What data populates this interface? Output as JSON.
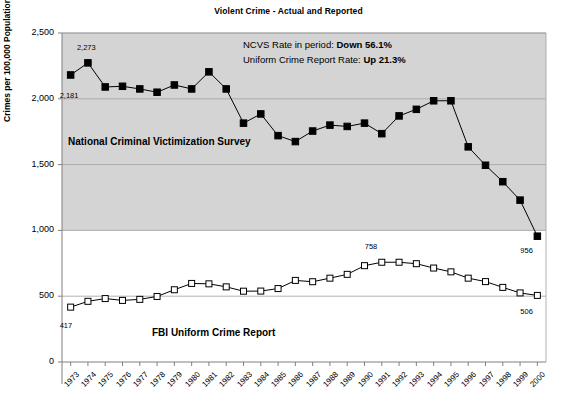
{
  "chart_data": {
    "type": "line",
    "title": "Violent Crime - Actual and Reported",
    "xlabel": "",
    "ylabel": "Crimes per 100,000 Population",
    "ylim": [
      0,
      2500
    ],
    "yticks": [
      0,
      500,
      1000,
      1500,
      2000,
      2500
    ],
    "ytick_labels": [
      "0",
      "500",
      "1,000",
      "1,500",
      "2,000",
      "2,500"
    ],
    "grid": true,
    "legend_position": "inline-labels",
    "categories": [
      "1973",
      "1974",
      "1975",
      "1976",
      "1977",
      "1978",
      "1979",
      "1980",
      "1981",
      "1982",
      "1983",
      "1984",
      "1985",
      "1986",
      "1987",
      "1988",
      "1989",
      "1990",
      "1991",
      "1992",
      "1993",
      "1994",
      "1995",
      "1996",
      "1997",
      "1998",
      "1999",
      "2000"
    ],
    "series": [
      {
        "name": "National Criminal Victimization Survey",
        "marker": "filled-square",
        "values": [
          2181,
          2273,
          2090,
          2095,
          2075,
          2050,
          2105,
          2075,
          2205,
          2075,
          1815,
          1885,
          1720,
          1675,
          1755,
          1800,
          1790,
          1815,
          1735,
          1870,
          1920,
          1985,
          1985,
          1635,
          1495,
          1370,
          1230,
          956
        ]
      },
      {
        "name": "FBI Uniform Crime Report",
        "marker": "open-square",
        "values": [
          417,
          461,
          482,
          468,
          476,
          498,
          549,
          597,
          594,
          571,
          538,
          539,
          558,
          620,
          610,
          637,
          666,
          732,
          758,
          758,
          747,
          714,
          685,
          637,
          611,
          567,
          525,
          506
        ]
      }
    ],
    "point_labels": [
      {
        "series": 0,
        "year": "1973",
        "text": "2,181",
        "dx": -2,
        "dy": 22
      },
      {
        "series": 0,
        "year": "1974",
        "text": "2,273",
        "dx": -2,
        "dy": -14
      },
      {
        "series": 0,
        "year": "2000",
        "text": "956",
        "dx": -8,
        "dy": 16
      },
      {
        "series": 1,
        "year": "1973",
        "text": "417",
        "dx": -2,
        "dy": 20
      },
      {
        "series": 1,
        "year": "1991",
        "text": "758",
        "dx": -8,
        "dy": -14
      },
      {
        "series": 1,
        "year": "2000",
        "text": "506",
        "dx": -8,
        "dy": 18
      }
    ],
    "series_labels": [
      {
        "text": "National Criminal Victimization Survey",
        "x": 68,
        "y": 136
      },
      {
        "text": "FBI Uniform Crime Report",
        "x": 152,
        "y": 327
      }
    ],
    "annotations": [
      {
        "prefix": "NCVS Rate in period: ",
        "bold": "Down 56.1%",
        "x": 243,
        "y": 39
      },
      {
        "prefix": "Uniform Crime Report Rate: ",
        "bold": "Up 21.3%",
        "x": 243,
        "y": 54
      }
    ],
    "shaded_band": {
      "from": 1000,
      "to": 2500,
      "color": "#d4d4d4"
    },
    "colors": {
      "line": "#000000",
      "grid": "#a0a0a0",
      "axis": "#808080",
      "plot_background": "#ffffff",
      "shading": "#d4d4d4"
    }
  }
}
